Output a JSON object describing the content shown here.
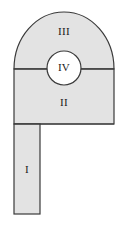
{
  "figure": {
    "type": "geometric-cross-section",
    "canvas": {
      "width": 125,
      "height": 229
    },
    "style": {
      "fill_color": "#e3e3e3",
      "stroke_color": "#3a3a3a",
      "background_color": "#ffffff",
      "label_color": "#1a1a1a",
      "stroke_width": 1.2,
      "hole_fill_color": "#ffffff"
    },
    "regions": [
      {
        "id": "I",
        "label": "I",
        "shape": "rectangle",
        "description": "vertical leg / stem at lower left",
        "x": 14,
        "y": 124,
        "width": 26,
        "height": 90,
        "label_x": 27,
        "label_y": 170
      },
      {
        "id": "II",
        "label": "II",
        "shape": "rectangle",
        "description": "middle rectangular web block",
        "x": 14,
        "y": 69,
        "width": 100,
        "height": 55,
        "label_x": 64,
        "label_y": 103
      },
      {
        "id": "III",
        "label": "III",
        "shape": "semicircle",
        "description": "upper semicircular arch cap",
        "center_x": 64,
        "center_y": 69,
        "radius_x": 50,
        "radius_y": 57,
        "label_x": 64,
        "label_y": 32
      },
      {
        "id": "IV",
        "label": "IV",
        "shape": "circle",
        "description": "circular opening centered on the division line",
        "center_x": 64,
        "center_y": 68,
        "radius": 17,
        "label_x": 64,
        "label_y": 68
      }
    ],
    "division_lines": [
      {
        "name": "arch-web-division",
        "description": "horizontal line separating region III from region II",
        "x1": 14,
        "y1": 69,
        "x2": 114,
        "y2": 69
      },
      {
        "name": "web-leg-division",
        "description": "horizontal line separating region II from region I",
        "x1": 14,
        "y1": 124,
        "x2": 114,
        "y2": 124
      }
    ]
  }
}
